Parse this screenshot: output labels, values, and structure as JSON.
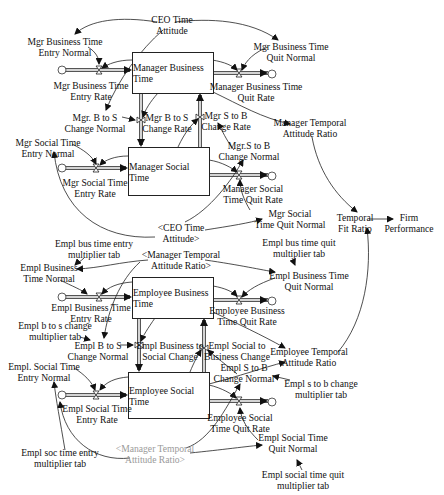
{
  "diagram": {
    "type": "system-dynamics-stock-flow",
    "stocks": [
      {
        "id": "mbt",
        "label": "Manager Business Time"
      },
      {
        "id": "mst",
        "label": "Manager Social Time"
      },
      {
        "id": "ebt",
        "label": "Employee Business Time"
      },
      {
        "id": "est",
        "label": "Employee Social Time"
      }
    ],
    "variables": {
      "ceo_time_attitude": "CEO Time\nAttitude",
      "mgr_bt_entry_normal": "Mgr Business Time\nEntry Normal",
      "mgr_bt_entry_rate": "Mgr Business Time\nEntry Rate",
      "mgr_bt_quit_normal": "Mgr Business Time\nQuit Normal",
      "mgr_bt_quit_rate": "Manager Business Time\nQuit Rate",
      "mgr_b_to_s_change_normal": "Mgr. B to S\nChange Normal",
      "mgr_b_to_s_change_rate": "Mgr B to S\nChange Rate",
      "mgr_s_to_b_change_rate": "Mgr S to B\nChange Rate",
      "mgr_s_to_b_change_normal": "Mgr.S to B\nChange Normal",
      "manager_temporal_attitude_ratio": "Manager Temporal\nAttitude Ratio",
      "mgr_st_entry_normal": "Mgr Social Time\nEntry Normal",
      "mgr_st_entry_rate": "Mgr Social Time\nEntry Rate",
      "mgr_st_quit_rate": "Manager Social\nTime Quit Rate",
      "mgr_st_quit_normal": "Mgr Social\nTime Quit Normal",
      "ceo_time_attitude_shadow": "<CEO Time\nAttitude>",
      "temporal_fit_ratio": "Temporal\nFit Ratio",
      "firm_performance": "Firm\nPerformance",
      "empl_bus_time_entry_mult_tab": "Empl bus time entry\nmultiplier tab",
      "empl_bus_time_quit_mult_tab": "Empl bus time quit\nmultiplier tab",
      "manager_temporal_attitude_ratio_shadow": "<Manager Temporal\nAttitude Ratio>",
      "empl_bt_normal": "Empl Business\nTime Normal",
      "empl_bt_quit_normal": "Empl Business Time\nQuit Normal",
      "empl_bt_entry_rate": "Empl Business Time\nEntry Rate",
      "empl_bt_quit_rate": "Employee Business\nTime Quit Rate",
      "empl_b_to_s_change_mult_tab": "Empl b to s change\nmultiplier tab",
      "empl_b_to_s_change_normal": "Empl B to S\nChange Normal",
      "empl_business_to_social_change": "Empl Business to\nSocial Change",
      "empl_social_to_business_change": "Empl Social to\nBusiness Change",
      "employee_temporal_attitude_ratio": "Employee Temporal\nAttitude Ratio",
      "empl_s_to_b_change_normal": "Empl S to B\nChange Normal",
      "empl_s_to_b_change_mult_tab": "Empl s to b change\nmultiplier tab",
      "empl_st_entry_normal": "Empl. Social Time\nEntry Normal",
      "empl_st_entry_rate": "Empl Social Time\nEntry Rate",
      "empl_st_quit_rate": "Employee Social\nTime Quit Rate",
      "empl_st_quit_normal": "Empl Social Time\nQuit Normal",
      "empl_soc_time_entry_mult_tab": "Empl soc time entry\nmultiplier tab",
      "manager_temporal_attitude_ratio_shadow2": "<Manager Temporal\nAttitude Ratio>",
      "empl_social_time_quit_mult_tab": "Empl social time quit\nmultiplier tab"
    },
    "colors": {
      "line": "#222222",
      "pipe": "#555555",
      "shadow_text": "#9a9a9a"
    }
  }
}
